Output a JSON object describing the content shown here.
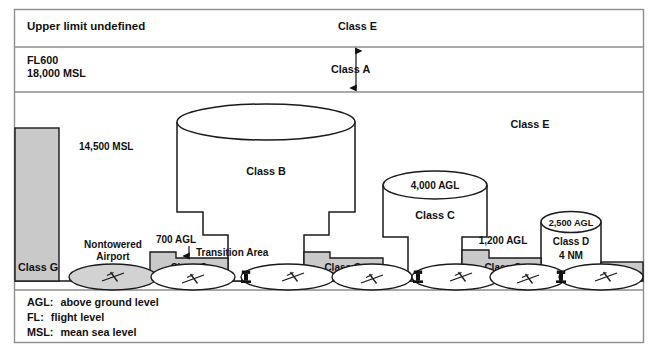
{
  "figure": {
    "caption_partial": ""
  },
  "colors": {
    "outline": "#1a1a1a",
    "class_g_fill": "#c9c9c9",
    "airport_fill_gray": "#d2d2d2",
    "airport_fill_white": "#ffffff",
    "background": "#ffffff",
    "frame_border": "#8d8d8d",
    "text": "#111111"
  },
  "bands": {
    "upper": {
      "left_label": "Upper limit undefined",
      "class_label": "Class E"
    },
    "class_a": {
      "left_label_line1": "FL600",
      "left_label_line2": "18,000 MSL",
      "class_label": "Class A"
    }
  },
  "altitudes": {
    "msl_14500": "14,500 MSL",
    "agl_700": "700 AGL",
    "agl_1200": "1,200 AGL",
    "agl_2500": "2,500 AGL",
    "agl_4000": "4,000 AGL"
  },
  "airspace_labels": {
    "class_e_middle": "Class E",
    "class_b": "Class B",
    "class_c": "Class C",
    "class_d": "Class D",
    "class_d_radius": "4 NM",
    "transition_area": "Transition Area",
    "nontowered_airport_line1": "Nontowered",
    "nontowered_airport_line2": "Airport"
  },
  "class_g_blocks": [
    {
      "id": "g-left",
      "label": "Class G"
    },
    {
      "id": "g-second",
      "label": "Class G"
    },
    {
      "id": "g-third",
      "label": "Class G"
    },
    {
      "id": "g-fourth",
      "label": "Class G"
    }
  ],
  "legend": {
    "items": [
      {
        "abbr": "AGL:",
        "definition": "above ground level"
      },
      {
        "abbr": "FL:",
        "definition": "flight level"
      },
      {
        "abbr": "MSL:",
        "definition": "mean sea level"
      }
    ]
  },
  "icons": {
    "control_tower": "control-tower-icon",
    "airport_runway": "airport-runway-icon",
    "arrow_double": "double-arrow-icon",
    "arrow_down": "arrow-down-icon"
  }
}
